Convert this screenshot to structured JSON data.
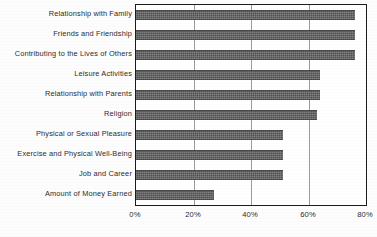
{
  "chart_data": {
    "type": "bar",
    "orientation": "horizontal",
    "title": "",
    "subtitle": "",
    "xlabel": "",
    "ylabel": "",
    "xlim": [
      0,
      80
    ],
    "ylim": null,
    "grid": true,
    "grid_axis": "x",
    "legend": false,
    "legend_position": "none",
    "value_suffix": "%",
    "categories": [
      "Relationship with Family",
      "Friends and Friendship",
      "Contributing to the Lives of Others",
      "Leisure Activities",
      "Relationship with Parents",
      "Religion",
      "Physical or Sexual Pleasure",
      "Exercise and Physical Well-Being",
      "Job and Career",
      "Amount of Money Earned"
    ],
    "values": [
      76,
      76,
      76,
      64,
      64,
      63,
      51,
      51,
      51,
      27
    ],
    "xticks": [
      0,
      20,
      40,
      60,
      80
    ],
    "xtick_labels": [
      "0%",
      "20%",
      "40%",
      "60%",
      "80%"
    ],
    "series": [
      {
        "name": "Percent rating as very important",
        "values": [
          76,
          76,
          76,
          64,
          64,
          63,
          51,
          51,
          51,
          27
        ]
      }
    ]
  },
  "style": {
    "bar_color": "#5c5c5c",
    "frame_color": "#1c1c1c",
    "grid_color": "#9a9a9a",
    "text_color": "#2b2b2b",
    "background": "#fdfdfd"
  }
}
